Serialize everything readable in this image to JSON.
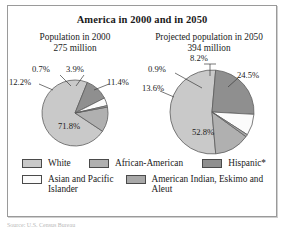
{
  "figure": {
    "title": "America in 2000 and in 2050",
    "source_note": "Source: U.S. Census Bureau"
  },
  "colors": {
    "white_group": "#c9c9c9",
    "african_american": "#b0b0b0",
    "hispanic": "#8f8f8f",
    "asian_pacific": "#fbfbfb",
    "american_indian": "#a8a8a8",
    "outline": "#5d5d5d",
    "frame": "#9a9a9a",
    "text": "#1a1a1a"
  },
  "panels": [
    {
      "heading_line1": "Population in 2000",
      "heading_line2": "275 million",
      "labels": {
        "white": "71.8%",
        "african_american": "12.2%",
        "hispanic": "11.4%",
        "asian_pacific": "3.9%",
        "american_indian": "0.7%"
      }
    },
    {
      "heading_line1": "Projected population in 2050",
      "heading_line2": "394 million",
      "labels": {
        "white": "52.8%",
        "african_american": "13.6%",
        "hispanic": "24.5%",
        "asian_pacific": "8.2%",
        "american_indian": "0.9%"
      }
    }
  ],
  "legend": {
    "row1": [
      {
        "label": "White",
        "key": "white_group"
      },
      {
        "label": "African-American",
        "key": "african_american"
      },
      {
        "label": "Hispanic*",
        "key": "hispanic"
      }
    ],
    "row2": [
      {
        "label": "Asian and Pacific Islander",
        "key": "asian_pacific"
      },
      {
        "label": "American Indian, Eskimo and Aleut",
        "key": "american_indian"
      }
    ]
  },
  "chart_data": [
    {
      "type": "pie",
      "title": "Population in 2000",
      "subtitle": "275 million",
      "categories": [
        "White",
        "African-American",
        "Hispanic*",
        "Asian and Pacific Islander",
        "American Indian, Eskimo and Aleut"
      ],
      "values": [
        71.8,
        12.2,
        11.4,
        3.9,
        0.7
      ],
      "unit": "percent",
      "total_population": "275 million",
      "legend_position": "bottom",
      "grid": false
    },
    {
      "type": "pie",
      "title": "Projected population in 2050",
      "subtitle": "394 million",
      "categories": [
        "White",
        "African-American",
        "Hispanic*",
        "Asian and Pacific Islander",
        "American Indian, Eskimo and Aleut"
      ],
      "values": [
        52.8,
        13.6,
        24.5,
        8.2,
        0.9
      ],
      "unit": "percent",
      "total_population": "394 million",
      "legend_position": "bottom",
      "grid": false
    }
  ]
}
